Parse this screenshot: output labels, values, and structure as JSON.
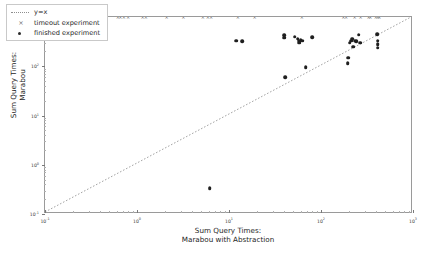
{
  "figure": {
    "background": "#ffffff",
    "frame_color": "#9a9a9a",
    "marker_color": "#1f1f1f",
    "timeout_color": "#6b6b6b",
    "line_color": "#8e8e8e"
  },
  "legend": {
    "position": "upper-left",
    "entries": [
      {
        "key": "line",
        "label": "y=x"
      },
      {
        "key": "cross",
        "label": "timeout experiment"
      },
      {
        "key": "dot",
        "label": "finished experiment"
      }
    ]
  },
  "chart_data": {
    "type": "scatter",
    "title": "",
    "xlabel": "Sum Query Times:\nMarabou with Abstraction",
    "xlabel_line1": "Sum Query Times:",
    "xlabel_line2": "Marabou with Abstraction",
    "ylabel": "Sum Query Times:\nMarabou",
    "ylabel_line1": "Sum Query Times:",
    "ylabel_line2": "Marabou",
    "xscale": "log",
    "yscale": "log",
    "xlim": [
      0.1,
      1000
    ],
    "ylim": [
      0.1,
      1000
    ],
    "grid": false,
    "xticks": [
      0.1,
      1,
      10,
      100,
      1000
    ],
    "xticklabels": [
      "10-1",
      "100",
      "101",
      "102",
      "103"
    ],
    "xtick_mantissa": [
      "10",
      "10",
      "10",
      "10",
      "10"
    ],
    "xtick_exponent": [
      "-1",
      "0",
      "1",
      "2",
      "3"
    ],
    "yticks": [
      0.1,
      1,
      10,
      100,
      1000
    ],
    "yticklabels": [
      "10-1",
      "100",
      "101",
      "102",
      "103"
    ],
    "ytick_mantissa": [
      "10",
      "10",
      "10",
      "10",
      "10"
    ],
    "ytick_exponent": [
      "-1",
      "0",
      "1",
      "2",
      "3"
    ],
    "reference_line": {
      "name": "y=x",
      "style": "dotted",
      "from": [
        0.1,
        0.1
      ],
      "to": [
        1000,
        1000
      ]
    },
    "series": [
      {
        "name": "finished experiment",
        "marker": "circle",
        "points": [
          [
            12.0,
            330.0
          ],
          [
            14.0,
            320.0
          ],
          [
            40.0,
            430.0
          ],
          [
            40.0,
            380.0
          ],
          [
            41.0,
            60.0
          ],
          [
            52.0,
            400.0
          ],
          [
            56.0,
            360.0
          ],
          [
            57.0,
            330.0
          ],
          [
            60.0,
            340.0
          ],
          [
            58.0,
            300.0
          ],
          [
            63.0,
            330.0
          ],
          [
            68.0,
            95.0
          ],
          [
            80.0,
            390.0
          ],
          [
            195.0,
            115.0
          ],
          [
            198.0,
            150.0
          ],
          [
            205.0,
            300.0
          ],
          [
            212.0,
            330.0
          ],
          [
            218.0,
            360.0
          ],
          [
            225.0,
            250.0
          ],
          [
            232.0,
            330.0
          ],
          [
            240.0,
            320.0
          ],
          [
            258.0,
            440.0
          ],
          [
            268.0,
            300.0
          ],
          [
            410.0,
            450.0
          ],
          [
            412.0,
            330.0
          ],
          [
            413.0,
            280.0
          ],
          [
            414.0,
            240.0
          ],
          [
            6.2,
            0.33
          ]
        ]
      },
      {
        "name": "timeout experiment",
        "marker": "x",
        "points": [
          [
            0.62,
            1000.0
          ],
          [
            0.66,
            1000.0
          ],
          [
            0.72,
            1000.0
          ],
          [
            0.8,
            1000.0
          ],
          [
            1.15,
            1000.0
          ],
          [
            1.25,
            1000.0
          ],
          [
            2.1,
            1000.0
          ],
          [
            3.2,
            1000.0
          ],
          [
            5.2,
            1000.0
          ],
          [
            5.9,
            1000.0
          ],
          [
            6.4,
            1000.0
          ],
          [
            12.5,
            1000.0
          ],
          [
            19.0,
            1000.0
          ],
          [
            62.0,
            1000.0
          ],
          [
            175.0,
            1000.0
          ],
          [
            188.0,
            1000.0
          ],
          [
            232.0,
            1000.0
          ],
          [
            270.0,
            1000.0
          ],
          [
            330.0,
            1000.0
          ],
          [
            345.0,
            1000.0
          ],
          [
            395.0,
            1000.0
          ],
          [
            415.0,
            1000.0
          ],
          [
            430.0,
            1000.0
          ]
        ]
      }
    ]
  }
}
